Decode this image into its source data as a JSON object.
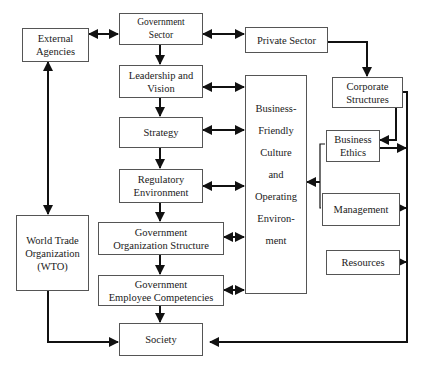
{
  "diagram": {
    "colors": {
      "line": "#111111",
      "box_border": "#555555",
      "background": "#ffffff"
    },
    "nodes": {
      "external_agencies": {
        "lines": [
          "External",
          "Agencies"
        ]
      },
      "government_sector": {
        "lines": [
          "Government",
          "Sector"
        ]
      },
      "private_sector": {
        "lines": [
          "Private Sector"
        ]
      },
      "leadership_vision": {
        "lines": [
          "Leadership and",
          "Vision"
        ]
      },
      "strategy": {
        "lines": [
          "Strategy"
        ]
      },
      "regulatory_environment": {
        "lines": [
          "Regulatory",
          "Environment"
        ]
      },
      "gov_org_structure": {
        "lines": [
          "Government",
          "Organization Structure"
        ]
      },
      "gov_employee_competencies": {
        "lines": [
          "Government",
          "Employee Competencies"
        ]
      },
      "society": {
        "lines": [
          "Society"
        ]
      },
      "wto": {
        "lines": [
          "World Trade",
          "Organization",
          "(WTO)"
        ]
      },
      "business_friendly": {
        "lines": [
          "Business-",
          "Friendly",
          "Culture",
          "and",
          "Operating",
          "Environ-",
          "ment"
        ]
      },
      "corporate_structures": {
        "lines": [
          "Corporate",
          "Structures"
        ]
      },
      "business_ethics": {
        "lines": [
          "Business",
          "Ethics"
        ]
      },
      "management": {
        "lines": [
          "Management"
        ]
      },
      "resources": {
        "lines": [
          "Resources"
        ]
      }
    },
    "edges": [
      {
        "from": "external_agencies",
        "to": "government_sector",
        "type": "bidirectional"
      },
      {
        "from": "government_sector",
        "to": "private_sector",
        "type": "bidirectional"
      },
      {
        "from": "government_sector",
        "to": "leadership_vision",
        "type": "directed"
      },
      {
        "from": "leadership_vision",
        "to": "strategy",
        "type": "directed"
      },
      {
        "from": "strategy",
        "to": "regulatory_environment",
        "type": "directed"
      },
      {
        "from": "regulatory_environment",
        "to": "gov_org_structure",
        "type": "directed"
      },
      {
        "from": "gov_org_structure",
        "to": "gov_employee_competencies",
        "type": "directed"
      },
      {
        "from": "gov_employee_competencies",
        "to": "society",
        "type": "directed"
      },
      {
        "from": "external_agencies",
        "to": "wto",
        "type": "bidirectional"
      },
      {
        "from": "wto",
        "to": "society",
        "type": "directed"
      },
      {
        "from": "leadership_vision",
        "to": "business_friendly",
        "type": "bidirectional"
      },
      {
        "from": "strategy",
        "to": "business_friendly",
        "type": "bidirectional"
      },
      {
        "from": "regulatory_environment",
        "to": "business_friendly",
        "type": "bidirectional"
      },
      {
        "from": "gov_org_structure",
        "to": "business_friendly",
        "type": "bidirectional"
      },
      {
        "from": "gov_employee_competencies",
        "to": "business_friendly",
        "type": "bidirectional"
      },
      {
        "from": "private_sector",
        "to": "corporate_structures",
        "type": "directed"
      },
      {
        "from": "corporate_structures",
        "to": "business_ethics",
        "type": "directed"
      },
      {
        "from": "business_ethics",
        "to": "business_friendly",
        "type": "directed"
      },
      {
        "from": "management",
        "to": "business_friendly",
        "type": "directed"
      },
      {
        "from": "corporate_structures",
        "to": "society",
        "type": "directed"
      },
      {
        "from": "business_ethics",
        "to": "society",
        "type": "directed"
      },
      {
        "from": "management",
        "to": "society",
        "type": "directed"
      },
      {
        "from": "resources",
        "to": "society",
        "type": "directed"
      }
    ]
  }
}
